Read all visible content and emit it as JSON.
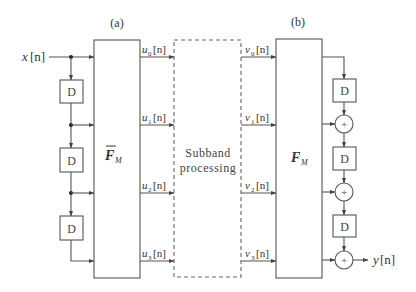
{
  "diagram": {
    "panel_a_label": "(a)",
    "panel_b_label": "(b)",
    "input": {
      "var": "x",
      "index": "[n]"
    },
    "output": {
      "var": "y",
      "index": "[n]"
    },
    "analysis_block": {
      "symbol": "F",
      "subscript": "M",
      "bar": true
    },
    "synthesis_block": {
      "symbol": "F",
      "subscript": "M",
      "bar": false
    },
    "center_block": {
      "line1": "Subband",
      "line2": "processing"
    },
    "delay_label": "D",
    "adder_label": "+",
    "u_signals": [
      {
        "var": "u",
        "sub": "0",
        "idx": "[n]"
      },
      {
        "var": "u",
        "sub": "1",
        "idx": "[n]"
      },
      {
        "var": "u",
        "sub": "2",
        "idx": "[n]"
      },
      {
        "var": "u",
        "sub": "3",
        "idx": "[n]"
      }
    ],
    "v_signals": [
      {
        "var": "v",
        "sub": "0",
        "idx": "[n]"
      },
      {
        "var": "v",
        "sub": "1",
        "idx": "[n]"
      },
      {
        "var": "v",
        "sub": "2",
        "idx": "[n]"
      },
      {
        "var": "v",
        "sub": "3",
        "idx": "[n]"
      }
    ]
  }
}
